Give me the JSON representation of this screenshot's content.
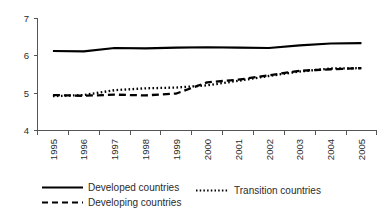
{
  "chart_data": {
    "type": "line",
    "title": "",
    "subtitle": "",
    "xlabel": "",
    "ylabel": "",
    "categories": [
      "1995",
      "1996",
      "1997",
      "1998",
      "1999",
      "2000",
      "2001",
      "2002",
      "2003",
      "2004",
      "2005"
    ],
    "ylim": [
      4,
      7
    ],
    "yticks": [
      4,
      5,
      6,
      7
    ],
    "ytick_labels": [
      "4",
      "5",
      "6",
      "7"
    ],
    "grid": false,
    "legend_position": "bottom",
    "series": [
      {
        "name": "Developed countries",
        "style": "solid",
        "color": "#000000",
        "values": [
          6.13,
          6.12,
          6.21,
          6.2,
          6.22,
          6.23,
          6.22,
          6.21,
          6.28,
          6.33,
          6.34
        ]
      },
      {
        "name": "Developing countries",
        "style": "dashed",
        "color": "#000000",
        "values": [
          4.95,
          4.93,
          4.96,
          4.94,
          4.99,
          5.29,
          5.36,
          5.48,
          5.6,
          5.64,
          5.67
        ]
      },
      {
        "name": "Transition countries",
        "style": "dotted",
        "color": "#000000",
        "values": [
          4.92,
          4.95,
          5.08,
          5.13,
          5.15,
          5.21,
          5.33,
          5.46,
          5.58,
          5.66,
          5.67
        ]
      }
    ]
  },
  "axes": {
    "y_tick_labels": [
      "7",
      "6",
      "5",
      "4"
    ],
    "x_tick_labels": [
      "1995",
      "1996",
      "1997",
      "1998",
      "1999",
      "2000",
      "2001",
      "2002",
      "2003",
      "2004",
      "2005"
    ]
  },
  "legend": {
    "entries": [
      {
        "label": "Developed countries",
        "style": "solid"
      },
      {
        "label": "Developing countries",
        "style": "dashed"
      },
      {
        "label": "Transition countries",
        "style": "dotted"
      }
    ]
  },
  "colors": {
    "line": "#000000",
    "axis": "#555555",
    "text": "#2b2b2b",
    "background": "#ffffff"
  }
}
